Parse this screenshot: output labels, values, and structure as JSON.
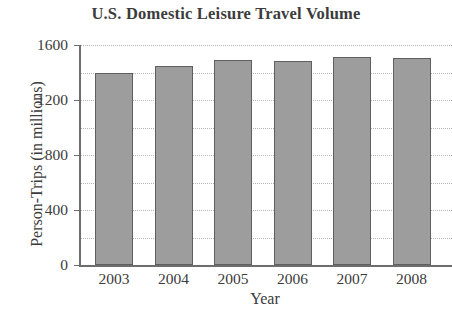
{
  "chart_data": {
    "type": "bar",
    "title": "U.S. Domestic Leisure Travel Volume",
    "xlabel": "Year",
    "ylabel": "Person-Trips (in millions)",
    "categories": [
      "2003",
      "2004",
      "2005",
      "2006",
      "2007",
      "2008"
    ],
    "values": [
      1400,
      1450,
      1490,
      1485,
      1510,
      1505
    ],
    "ylim": [
      0,
      1600
    ],
    "yticks": [
      0,
      400,
      800,
      1200,
      1600
    ],
    "ytick_labels": [
      "0",
      "400",
      "800",
      "1200",
      "1600"
    ],
    "minor_gridline_step": 200,
    "grid": true,
    "grid_style": "dotted",
    "legend": null,
    "legend_position": "none",
    "colors": {
      "bar_fill": "#9d9d9d",
      "bar_border": "#5f5f5f",
      "gridline": "#b4b4b4",
      "axis": "#6d6d6d",
      "text": "#3c3c3c",
      "background": "#ffffff"
    }
  }
}
